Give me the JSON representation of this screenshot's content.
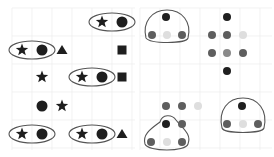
{
  "colors": {
    "background": "#ffffff",
    "grid": "#ececec",
    "shape": "#1e1e1e",
    "outline": "#555555",
    "dot_dark": "#1f1f1f",
    "dot_medium": "#5e5e5e",
    "dot_mid_light": "#8a8a8a",
    "dot_light": "#dedede"
  },
  "left_panel": {
    "rows": [
      {
        "y": 22,
        "items": [
          {
            "type": "star",
            "x": 102
          },
          {
            "type": "circle",
            "x": 122
          }
        ],
        "groups": [
          {
            "x1": 102,
            "x2": 122
          }
        ]
      },
      {
        "y": 50,
        "items": [
          {
            "type": "star",
            "x": 22
          },
          {
            "type": "circle",
            "x": 42
          },
          {
            "type": "triangle",
            "x": 62
          },
          {
            "type": "square",
            "x": 122
          }
        ],
        "groups": [
          {
            "x1": 22,
            "x2": 42
          }
        ]
      },
      {
        "y": 77,
        "items": [
          {
            "type": "star",
            "x": 42
          },
          {
            "type": "star",
            "x": 82
          },
          {
            "type": "circle",
            "x": 102
          },
          {
            "type": "square",
            "x": 122
          }
        ],
        "groups": [
          {
            "x1": 82,
            "x2": 102
          }
        ]
      },
      {
        "y": 106,
        "items": [
          {
            "type": "circle",
            "x": 42
          },
          {
            "type": "star",
            "x": 62
          }
        ],
        "groups": []
      },
      {
        "y": 134,
        "items": [
          {
            "type": "star",
            "x": 22
          },
          {
            "type": "circle",
            "x": 42
          },
          {
            "type": "star",
            "x": 82
          },
          {
            "type": "circle",
            "x": 102
          },
          {
            "type": "triangle",
            "x": 122
          }
        ],
        "groups": [
          {
            "x1": 22,
            "x2": 42
          },
          {
            "x1": 82,
            "x2": 102
          }
        ]
      }
    ]
  },
  "right_panel": {
    "dots": [
      {
        "x": 166,
        "y": 17,
        "shade": "dark"
      },
      {
        "x": 152,
        "y": 35,
        "shade": "medium"
      },
      {
        "x": 167,
        "y": 35,
        "shade": "light"
      },
      {
        "x": 182,
        "y": 35,
        "shade": "medium"
      },
      {
        "x": 227,
        "y": 17,
        "shade": "dark"
      },
      {
        "x": 212,
        "y": 35,
        "shade": "medium"
      },
      {
        "x": 227,
        "y": 35,
        "shade": "medium"
      },
      {
        "x": 243,
        "y": 35,
        "shade": "light"
      },
      {
        "x": 212,
        "y": 53,
        "shade": "medium"
      },
      {
        "x": 227,
        "y": 53,
        "shade": "mid_light"
      },
      {
        "x": 243,
        "y": 53,
        "shade": "medium"
      },
      {
        "x": 227,
        "y": 71,
        "shade": "dark"
      },
      {
        "x": 166,
        "y": 106,
        "shade": "medium"
      },
      {
        "x": 182,
        "y": 106,
        "shade": "medium"
      },
      {
        "x": 198,
        "y": 106,
        "shade": "light"
      },
      {
        "x": 166,
        "y": 124,
        "shade": "dark"
      },
      {
        "x": 182,
        "y": 124,
        "shade": "medium"
      },
      {
        "x": 151,
        "y": 142,
        "shade": "medium"
      },
      {
        "x": 167,
        "y": 142,
        "shade": "light"
      },
      {
        "x": 182,
        "y": 142,
        "shade": "medium"
      },
      {
        "x": 242,
        "y": 106,
        "shade": "dark"
      },
      {
        "x": 227,
        "y": 124,
        "shade": "medium"
      },
      {
        "x": 243,
        "y": 124,
        "shade": "light"
      },
      {
        "x": 258,
        "y": 124,
        "shade": "medium"
      }
    ],
    "enclosures": [
      {
        "name": "top-left-group",
        "path": "M146 38 C142 22 152 10 167 10 C182 10 192 22 188 38 C186 44 150 44 146 38 Z"
      },
      {
        "name": "bottom-left-group",
        "path": "M145 144 C142 134 152 128 160 122 C162 114 172 114 176 120 C182 128 192 134 188 144 C186 152 148 152 145 144 Z"
      },
      {
        "name": "bottom-right-group",
        "path": "M222 128 C218 110 228 98 243 98 C258 98 268 110 264 128 C262 134 224 134 222 128 Z"
      }
    ]
  }
}
